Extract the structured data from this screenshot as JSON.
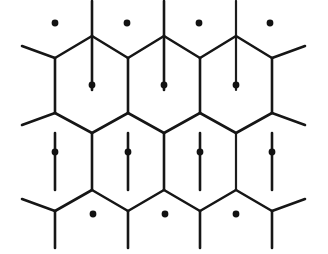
{
  "figure": {
    "kind": "honeycomb-lattice-diagram",
    "background_color": "#ffffff",
    "line_color": "#161616",
    "dot_color": "#121212",
    "line_width": 2.6,
    "dot_radius": 3.4,
    "canvas": {
      "width": 328,
      "height": 254
    }
  },
  "chart_data": {
    "type": "scatter",
    "xlabel": "",
    "ylabel": "",
    "xlim": [
      0,
      328
    ],
    "ylim": [
      0,
      254
    ],
    "grid": false,
    "legend": "none",
    "lattice": {
      "cell_shape": "hexagon",
      "orientation": "pointy-top",
      "column_pitch_px": 72,
      "row_pitch_px": 130,
      "half_row_offset_px": 37,
      "hexagon_side_vertical_px": 55,
      "hexagon_half_width_px": 37,
      "hexagon_apex_rise_px": 22
    },
    "dot_rows": [
      {
        "name": "row-1",
        "y": 23,
        "x": [
          55,
          127,
          199,
          270
        ]
      },
      {
        "name": "row-2",
        "y": 85,
        "x": [
          92,
          164,
          236
        ]
      },
      {
        "name": "row-3",
        "y": 152,
        "x": [
          55,
          128,
          200,
          272
        ]
      },
      {
        "name": "row-4",
        "y": 214,
        "x": [
          93,
          165,
          236
        ]
      }
    ],
    "dot_count_total": 14,
    "complete_hexagon_count": 6
  },
  "geometry": {
    "vertices_note": "Y-junctions where three cell walls meet",
    "junction_rows_y": [
      36,
      58,
      113,
      133,
      190,
      211
    ],
    "vertical_wall_columns_row_a": [
      55,
      128,
      200,
      272
    ],
    "vertical_wall_columns_row_b": [
      92,
      164,
      236
    ]
  },
  "elements": {
    "canvas_label": "hexagonal cell lattice",
    "dot_label": "cell centre point",
    "wall_label": "cell boundary wall"
  }
}
